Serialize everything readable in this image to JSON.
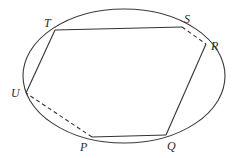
{
  "diagram": {
    "title": "",
    "ellipse": {
      "cx": 124,
      "cy": 76,
      "rx": 101,
      "ry": 67,
      "stroke": "#3a3a3a"
    },
    "points": {
      "T": {
        "x": 55,
        "y": 30,
        "label": "T",
        "lx": 44,
        "ly": 27
      },
      "S": {
        "x": 182,
        "y": 27,
        "label": "S",
        "lx": 184,
        "ly": 23
      },
      "R": {
        "x": 206,
        "y": 44,
        "label": "R",
        "lx": 211,
        "ly": 50
      },
      "U": {
        "x": 26,
        "y": 93,
        "label": "U",
        "lx": 11,
        "ly": 97
      },
      "P": {
        "x": 92,
        "y": 137,
        "label": "P",
        "lx": 80,
        "ly": 151
      },
      "Q": {
        "x": 166,
        "y": 135,
        "label": "Q",
        "lx": 167,
        "ly": 150
      }
    },
    "segments": [
      {
        "from": "T",
        "to": "S",
        "style": "solid"
      },
      {
        "from": "S",
        "to": "R",
        "style": "dashed"
      },
      {
        "from": "R",
        "to": "Q",
        "style": "solid"
      },
      {
        "from": "Q",
        "to": "P",
        "style": "solid"
      },
      {
        "from": "P",
        "to": "U",
        "style": "dashed"
      },
      {
        "from": "U",
        "to": "T",
        "style": "solid"
      }
    ],
    "labels": [
      "T",
      "S",
      "R",
      "U",
      "P",
      "Q"
    ]
  }
}
